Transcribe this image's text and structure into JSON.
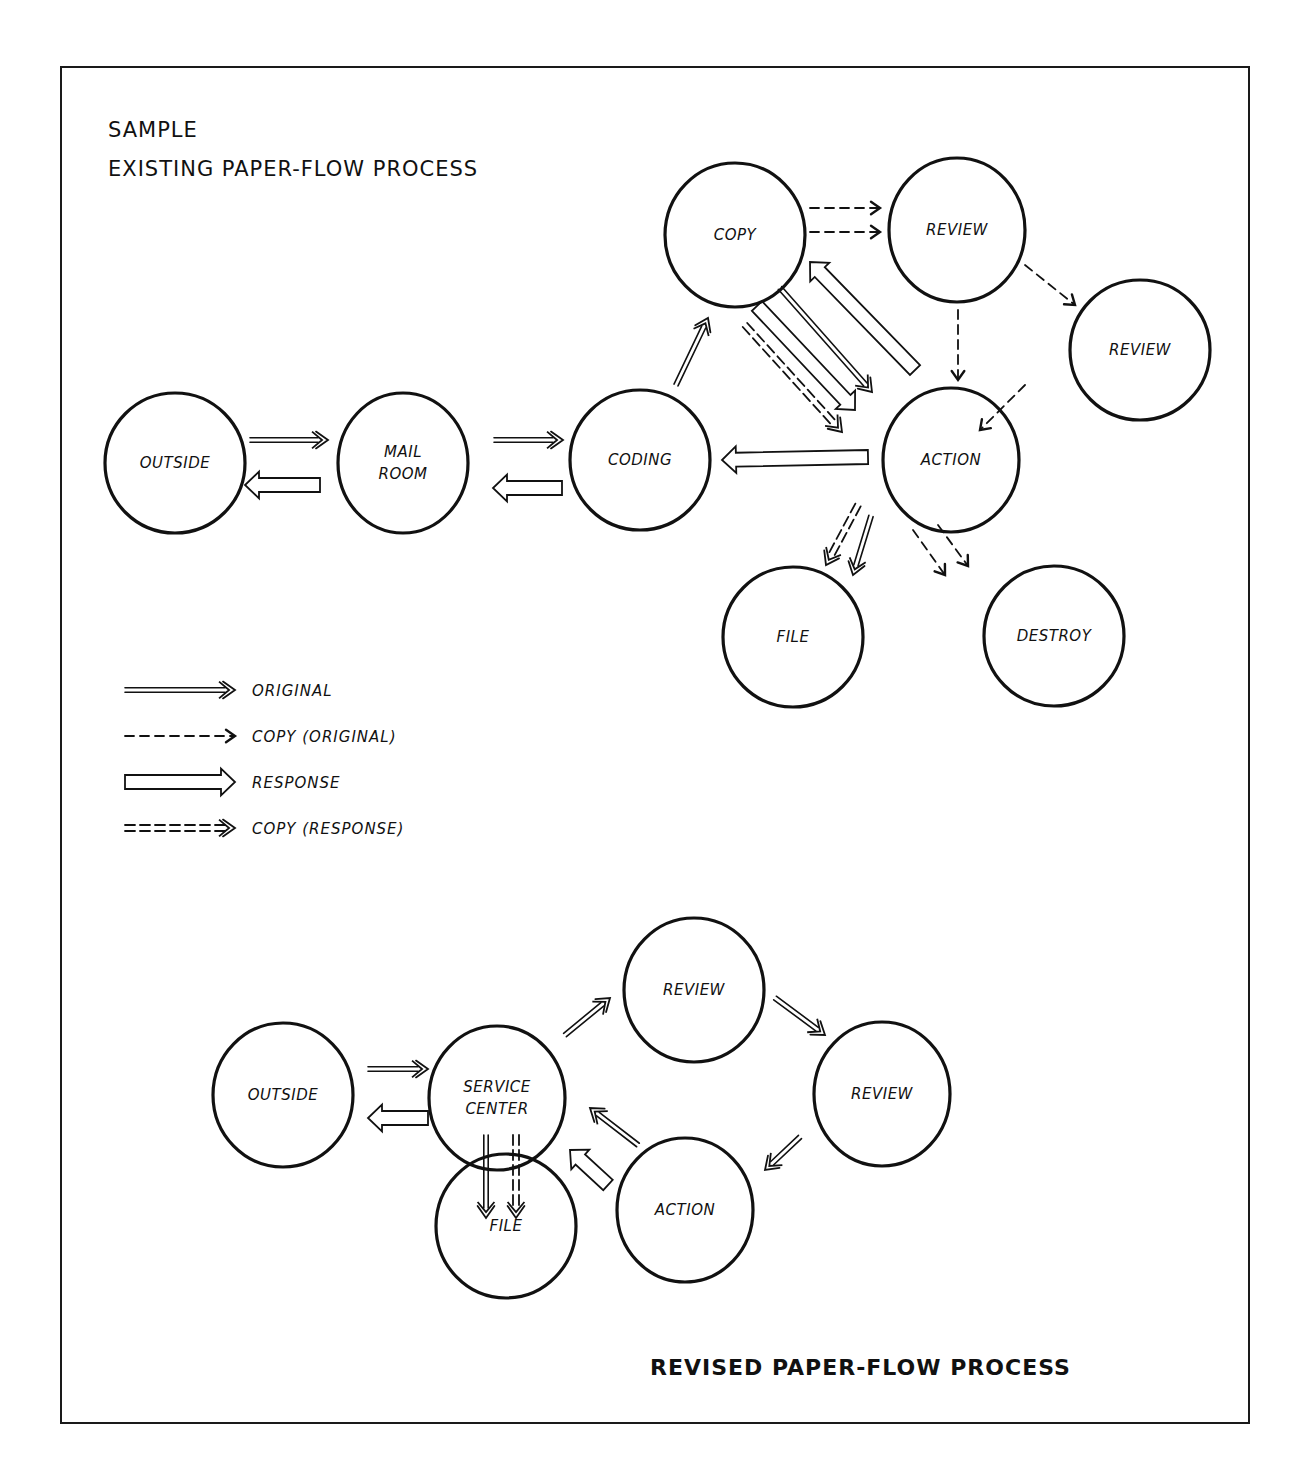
{
  "titles": {
    "top_line1": "SAMPLE",
    "top_line2": "EXISTING PAPER-FLOW PROCESS",
    "bottom": "REVISED PAPER-FLOW PROCESS"
  },
  "colors": {
    "ink": "#111111",
    "paper": "#ffffff"
  },
  "legend": [
    {
      "type": "original",
      "label": "ORIGINAL"
    },
    {
      "type": "copy_original",
      "label": "COPY (ORIGINAL)"
    },
    {
      "type": "response",
      "label": "RESPONSE"
    },
    {
      "type": "copy_response",
      "label": "COPY (RESPONSE)"
    }
  ],
  "existing": {
    "nodes": [
      {
        "id": "outside",
        "label": "OUTSIDE",
        "cx": 175,
        "cy": 463,
        "rx": 70,
        "ry": 70
      },
      {
        "id": "mailroom",
        "label": "MAIL|ROOM",
        "cx": 403,
        "cy": 463,
        "rx": 65,
        "ry": 70
      },
      {
        "id": "coding",
        "label": "CODING",
        "cx": 640,
        "cy": 460,
        "rx": 70,
        "ry": 70
      },
      {
        "id": "copy",
        "label": "COPY",
        "cx": 735,
        "cy": 235,
        "rx": 70,
        "ry": 72
      },
      {
        "id": "review1",
        "label": "REVIEW",
        "cx": 957,
        "cy": 230,
        "rx": 68,
        "ry": 72
      },
      {
        "id": "review2",
        "label": "REVIEW",
        "cx": 1140,
        "cy": 350,
        "rx": 70,
        "ry": 70
      },
      {
        "id": "action",
        "label": "ACTION",
        "cx": 951,
        "cy": 460,
        "rx": 68,
        "ry": 72
      },
      {
        "id": "file",
        "label": "FILE",
        "cx": 793,
        "cy": 637,
        "rx": 70,
        "ry": 70
      },
      {
        "id": "destroy",
        "label": "DESTROY",
        "cx": 1054,
        "cy": 636,
        "rx": 70,
        "ry": 70
      }
    ],
    "edges": [
      {
        "type": "original",
        "x1": 250,
        "y1": 440,
        "x2": 328,
        "y2": 440
      },
      {
        "type": "response",
        "x1": 320,
        "y1": 485,
        "x2": 245,
        "y2": 485
      },
      {
        "type": "original",
        "x1": 494,
        "y1": 440,
        "x2": 563,
        "y2": 440
      },
      {
        "type": "response",
        "x1": 562,
        "y1": 488,
        "x2": 493,
        "y2": 488
      },
      {
        "type": "original",
        "x1": 676,
        "y1": 385,
        "x2": 708,
        "y2": 318
      },
      {
        "type": "copy_original",
        "x1": 810,
        "y1": 208,
        "x2": 880,
        "y2": 208
      },
      {
        "type": "copy_original",
        "x1": 810,
        "y1": 232,
        "x2": 880,
        "y2": 232
      },
      {
        "type": "response",
        "x1": 915,
        "y1": 370,
        "x2": 810,
        "y2": 262
      },
      {
        "type": "original",
        "x1": 780,
        "y1": 288,
        "x2": 872,
        "y2": 392
      },
      {
        "type": "response",
        "x1": 757,
        "y1": 306,
        "x2": 855,
        "y2": 410
      },
      {
        "type": "copy_response",
        "x1": 745,
        "y1": 325,
        "x2": 842,
        "y2": 432
      },
      {
        "type": "copy_original",
        "x1": 958,
        "y1": 310,
        "x2": 958,
        "y2": 380
      },
      {
        "type": "copy_original",
        "x1": 1025,
        "y1": 265,
        "x2": 1075,
        "y2": 305
      },
      {
        "type": "copy_original",
        "x1": 1025,
        "y1": 385,
        "x2": 980,
        "y2": 430
      },
      {
        "type": "response",
        "x1": 868,
        "y1": 457,
        "x2": 722,
        "y2": 460
      },
      {
        "type": "copy_response",
        "x1": 858,
        "y1": 505,
        "x2": 826,
        "y2": 565
      },
      {
        "type": "original",
        "x1": 871,
        "y1": 516,
        "x2": 853,
        "y2": 575
      },
      {
        "type": "copy_original",
        "x1": 913,
        "y1": 530,
        "x2": 945,
        "y2": 575
      },
      {
        "type": "copy_original",
        "x1": 938,
        "y1": 525,
        "x2": 968,
        "y2": 566
      }
    ]
  },
  "revised": {
    "nodes": [
      {
        "id": "outside",
        "label": "OUTSIDE",
        "cx": 283,
        "cy": 1095,
        "rx": 70,
        "ry": 72
      },
      {
        "id": "service",
        "label": "SERVICE|CENTER",
        "cx": 497,
        "cy": 1098,
        "rx": 68,
        "ry": 72
      },
      {
        "id": "review1",
        "label": "REVIEW",
        "cx": 694,
        "cy": 990,
        "rx": 70,
        "ry": 72
      },
      {
        "id": "review2",
        "label": "REVIEW",
        "cx": 882,
        "cy": 1094,
        "rx": 68,
        "ry": 72
      },
      {
        "id": "action",
        "label": "ACTION",
        "cx": 685,
        "cy": 1210,
        "rx": 68,
        "ry": 72
      },
      {
        "id": "file",
        "label": "FILE",
        "cx": 506,
        "cy": 1226,
        "rx": 70,
        "ry": 72
      }
    ],
    "edges": [
      {
        "type": "original",
        "x1": 368,
        "y1": 1069,
        "x2": 428,
        "y2": 1069
      },
      {
        "type": "response",
        "x1": 428,
        "y1": 1118,
        "x2": 368,
        "y2": 1118
      },
      {
        "type": "original",
        "x1": 565,
        "y1": 1035,
        "x2": 610,
        "y2": 998
      },
      {
        "type": "original",
        "x1": 775,
        "y1": 998,
        "x2": 825,
        "y2": 1035
      },
      {
        "type": "original",
        "x1": 800,
        "y1": 1137,
        "x2": 765,
        "y2": 1170
      },
      {
        "type": "original",
        "x1": 638,
        "y1": 1145,
        "x2": 590,
        "y2": 1108
      },
      {
        "type": "response",
        "x1": 608,
        "y1": 1185,
        "x2": 570,
        "y2": 1150
      },
      {
        "type": "original",
        "x1": 486,
        "y1": 1135,
        "x2": 486,
        "y2": 1218
      },
      {
        "type": "copy_response",
        "x1": 516,
        "y1": 1135,
        "x2": 516,
        "y2": 1218
      }
    ]
  }
}
